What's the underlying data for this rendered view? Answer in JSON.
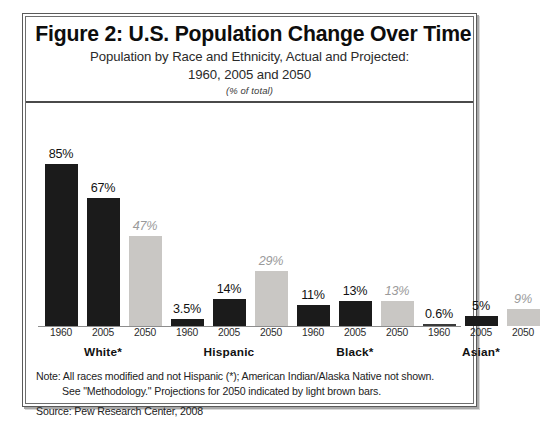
{
  "figure": {
    "title": "Figure 2: U.S. Population Change Over Time",
    "subtitle_line_1": "Population by Race and Ethnicity, Actual and Projected:",
    "subtitle_line_2": "1960, 2005 and 2050",
    "subtitle_unit": "(% of total)",
    "note_line_1": "Note: All races modified and not Hispanic (*); American Indian/Alaska Native not shown.",
    "note_line_2": "See \"Methodology.\"  Projections for 2050 indicated by light brown bars.",
    "source": "Source: Pew Research Center, 2008"
  },
  "colors": {
    "actual_bar": "#1b1b1b",
    "projected_bar": "#c9c7c4",
    "projected_label": "#9a9a9a",
    "frame": "#5a5a5a",
    "baseline": "#8d8d8d"
  },
  "chart_data": {
    "type": "bar",
    "title": "Figure 2: U.S. Population Change Over Time",
    "subtitle": "Population by Race and Ethnicity, Actual and Projected: 1960, 2005 and 2050",
    "xlabel": "",
    "ylabel": "",
    "unit": "(% of total)",
    "ylim": [
      0,
      90
    ],
    "grid": false,
    "legend": "none",
    "categories": [
      "White*",
      "Hispanic",
      "Black*",
      "Asian*"
    ],
    "x": [
      "1960",
      "2005",
      "2050"
    ],
    "series": [
      {
        "name": "1960",
        "kind": "actual",
        "values": [
          85,
          3.5,
          11,
          0.6
        ],
        "labels": [
          "85%",
          "3.5%",
          "11%",
          "0.6%"
        ]
      },
      {
        "name": "2005",
        "kind": "actual",
        "values": [
          67,
          14,
          13,
          5
        ],
        "labels": [
          "67%",
          "14%",
          "13%",
          "5%"
        ]
      },
      {
        "name": "2050",
        "kind": "projected",
        "values": [
          47,
          29,
          13,
          9
        ],
        "labels": [
          "47%",
          "29%",
          "13%",
          "9%"
        ]
      }
    ],
    "groups": [
      {
        "name": "White*",
        "bars": [
          {
            "year": "1960",
            "value": 85,
            "label": "85%",
            "projected": false
          },
          {
            "year": "2005",
            "value": 67,
            "label": "67%",
            "projected": false
          },
          {
            "year": "2050",
            "value": 47,
            "label": "47%",
            "projected": true
          }
        ]
      },
      {
        "name": "Hispanic",
        "bars": [
          {
            "year": "1960",
            "value": 3.5,
            "label": "3.5%",
            "projected": false
          },
          {
            "year": "2005",
            "value": 14,
            "label": "14%",
            "projected": false
          },
          {
            "year": "2050",
            "value": 29,
            "label": "29%",
            "projected": true
          }
        ]
      },
      {
        "name": "Black*",
        "bars": [
          {
            "year": "1960",
            "value": 11,
            "label": "11%",
            "projected": false
          },
          {
            "year": "2005",
            "value": 13,
            "label": "13%",
            "projected": false
          },
          {
            "year": "2050",
            "value": 13,
            "label": "13%",
            "projected": true
          }
        ]
      },
      {
        "name": "Asian*",
        "bars": [
          {
            "year": "1960",
            "value": 0.6,
            "label": "0.6%",
            "projected": false
          },
          {
            "year": "2005",
            "value": 5,
            "label": "5%",
            "projected": false
          },
          {
            "year": "2050",
            "value": 9,
            "label": "9%",
            "projected": true
          }
        ]
      }
    ]
  }
}
